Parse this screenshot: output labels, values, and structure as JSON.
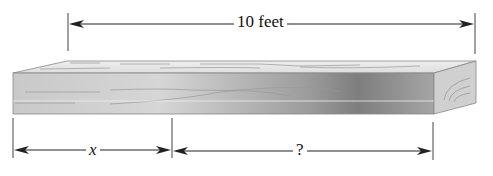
{
  "diagram": {
    "type": "wooden board length diagram",
    "total_length_label": "10 feet",
    "left_segment_label": "x",
    "right_segment_label": "?",
    "colors": {
      "line": "#222222",
      "board_top": "#e4e4e4",
      "board_front_light": "#d2d2d2",
      "board_front_dark": "#8a8a8a",
      "board_end": "#cfcfcf"
    }
  }
}
